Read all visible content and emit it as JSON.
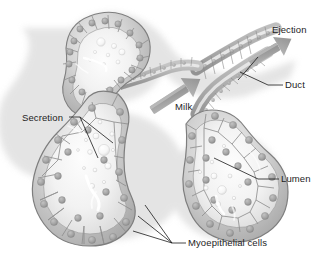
{
  "figure": {
    "palette": {
      "background": "#ffffff",
      "tissue_light": "#e6e6e6",
      "tissue_mid": "#c4c4c4",
      "tissue_dark": "#9a9a9a",
      "tissue_outline": "#7c7c7c",
      "nucleus": "#9e9e9e",
      "lumen": "#f4f4f4",
      "droplet": "#fbfbfb",
      "arrow": "#9b9b9b",
      "leader_line": "#1a1a1a",
      "label_text": "#1d1d1d",
      "shadow": "#d9d9d9"
    }
  },
  "labels": [
    {
      "id": "ejection",
      "text": "Ejection",
      "x": 272,
      "y": 33,
      "anchor": "start"
    },
    {
      "id": "duct",
      "text": "Duct",
      "x": 285,
      "y": 88,
      "anchor": "start"
    },
    {
      "id": "milk",
      "text": "Milk",
      "x": 175,
      "y": 110,
      "anchor": "start"
    },
    {
      "id": "lumen",
      "text": "Lumen",
      "x": 281,
      "y": 182,
      "anchor": "start"
    },
    {
      "id": "secretion",
      "text": "Secretion",
      "x": 22,
      "y": 121,
      "anchor": "start"
    },
    {
      "id": "myoepithelial-cells",
      "text": "Myoepithelial cells",
      "x": 188,
      "y": 246,
      "anchor": "start"
    }
  ],
  "arrows": [
    {
      "id": "milk-arrow",
      "label": "Milk",
      "from_x": 152,
      "from_y": 111,
      "to_x": 196,
      "to_y": 82,
      "direction": "up-right"
    },
    {
      "id": "ejection-arrow",
      "label": "Ejection",
      "from_x": 250,
      "from_y": 63,
      "to_x": 288,
      "to_y": 41,
      "direction": "up-right"
    }
  ],
  "leader_lines": [
    {
      "id": "ejection-leader",
      "points": "258,57 245,72 238,80"
    },
    {
      "id": "duct-leader",
      "points": "283,85 268,85 240,72"
    },
    {
      "id": "lumen-leader",
      "points": "279,179 258,179 214,158"
    },
    {
      "id": "secretion-leader-a",
      "points": "69,117 78,117 113,143"
    },
    {
      "id": "secretion-leader-b",
      "points": "69,117 78,117 98,158"
    },
    {
      "id": "myo-leader-a",
      "points": "186,243 170,243 145,205"
    },
    {
      "id": "myo-leader-b",
      "points": "186,243 170,243 138,216"
    },
    {
      "id": "myo-leader-c",
      "points": "186,243 170,243 133,231"
    }
  ],
  "structures": [
    {
      "id": "upper-left-alveolus",
      "kind": "alveolus",
      "center_x": 104,
      "center_y": 60
    },
    {
      "id": "lower-left-alveolus",
      "kind": "alveolus",
      "center_x": 110,
      "center_y": 175
    },
    {
      "id": "right-alveolus",
      "kind": "alveolus",
      "center_x": 225,
      "center_y": 185
    },
    {
      "id": "upper-right-duct",
      "kind": "duct",
      "center_x": 230,
      "center_y": 60
    },
    {
      "id": "connecting-duct",
      "kind": "duct",
      "center_x": 160,
      "center_y": 100
    }
  ]
}
